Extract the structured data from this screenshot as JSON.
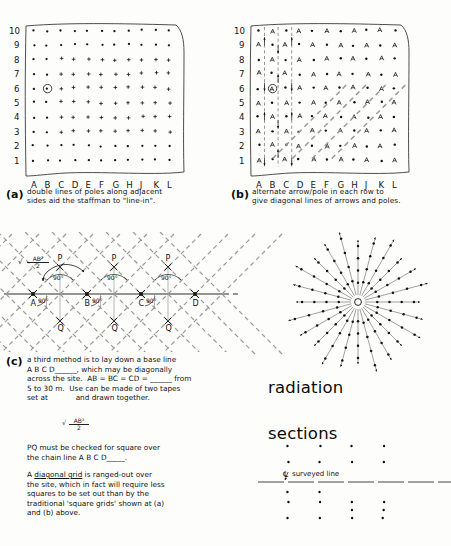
{
  "figure": {
    "title_note": "Setting-out survey grids: square grids, diagonal grid, radiation and sections"
  },
  "grid_a": {
    "id": "a",
    "row_labels": [
      "10",
      "9",
      "8",
      "7",
      "6",
      "5",
      "4",
      "3",
      "2",
      "1"
    ],
    "col_labels": [
      "A",
      "B",
      "C",
      "D",
      "E",
      "F",
      "G",
      "H",
      "J",
      "K",
      "L"
    ],
    "station": {
      "col": "B",
      "row": "6",
      "marker": "circled-dot"
    },
    "caption_line1": "double lines of poles along adjacent",
    "caption_line2": "sides aid the staffman to \"line-in\"."
  },
  "grid_b": {
    "id": "b",
    "row_labels": [
      "10",
      "9",
      "8",
      "7",
      "6",
      "5",
      "4",
      "3",
      "2",
      "1"
    ],
    "col_labels": [
      "A",
      "B",
      "C",
      "D",
      "E",
      "F",
      "G",
      "H",
      "J",
      "K",
      "L"
    ],
    "station": {
      "col": "B",
      "row": "6",
      "marker": "circled-dot"
    },
    "caption_line1": "alternate arrow/pole in each row to",
    "caption_line2": "give diagonal lines of arrows and poles."
  },
  "diagram_c": {
    "id": "c",
    "base_points": [
      "A",
      "B",
      "C",
      "D"
    ],
    "apex_label": "P",
    "base_label": "Q",
    "angle_upper": "90°",
    "angle_lower": "90°",
    "formula": {
      "radical": "√",
      "numerator": "AB",
      "power": "2",
      "denominator": "2"
    },
    "text_lines": [
      "a third method is to lay down a base line",
      "A B C D______, which may be diagonally",
      "across the site.  AB = BC = CD = ______ from",
      "5 to 30 m.  Use can be made of two tapes",
      "set at            and drawn together."
    ],
    "text_lines_2": [
      "PQ must be checked for square over",
      "the chain line A B C D_____."
    ],
    "text_lines_3": [
      "A diagonal grid is ranged-out over",
      "the site, which in fact will require less",
      "squares to be set out than by the",
      "traditional 'square grids' shown at (a)",
      "and (b) above."
    ],
    "underlined_phrase": "diagonal grid"
  },
  "radiation": {
    "label": "radiation",
    "ray_count": 24,
    "center_marker": "station-circle",
    "points_per_ray": 4
  },
  "sections": {
    "label": "sections",
    "line_label": "surveyed line",
    "centerline_symbol": "℄",
    "dot_columns": 4
  },
  "colors": {
    "ink": "#141414",
    "paper": "#fdfdfc",
    "dash": "#9a9a9a"
  }
}
